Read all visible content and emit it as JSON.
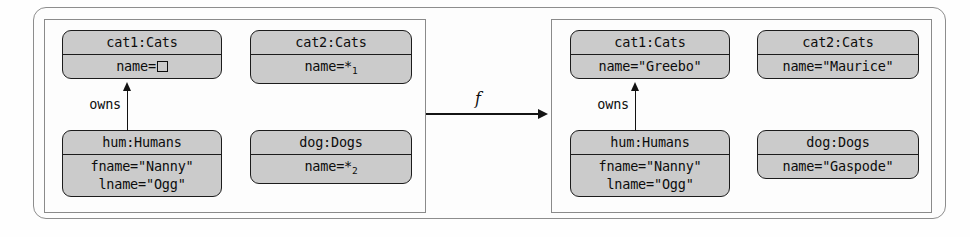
{
  "figure": {
    "background_color": "#fefefe",
    "box_fill_color": "#cbcbcb",
    "box_border_color": "#1c1c1c",
    "line_color": "#121212"
  },
  "transform_arrow": {
    "label": "f",
    "direction": "left-to-right"
  },
  "source_model": {
    "panel_name": "source-model-panel",
    "objects": [
      {
        "id": "cat1",
        "header": "cat1:Cats",
        "slots": [
          "name="
        ],
        "slot_glyph": "empty-square",
        "has_empty_square": true
      },
      {
        "id": "cat2",
        "header": "cat2:Cats",
        "slots": [
          "name=*"
        ],
        "subscript": "1",
        "has_empty_square": false
      },
      {
        "id": "hum",
        "header": "hum:Humans",
        "slots": [
          "fname=\"Nanny\"",
          "lname=\"Ogg\""
        ],
        "has_empty_square": false
      },
      {
        "id": "dog",
        "header": "dog:Dogs",
        "slots": [
          "name=*"
        ],
        "subscript": "2",
        "has_empty_square": false
      }
    ],
    "links": [
      {
        "label": "owns",
        "from": "hum",
        "to": "cat1"
      }
    ]
  },
  "target_model": {
    "panel_name": "target-model-panel",
    "objects": [
      {
        "id": "cat1",
        "header": "cat1:Cats",
        "slots": [
          "name=\"Greebo\""
        ],
        "has_empty_square": false
      },
      {
        "id": "cat2",
        "header": "cat2:Cats",
        "slots": [
          "name=\"Maurice\""
        ],
        "has_empty_square": false
      },
      {
        "id": "hum",
        "header": "hum:Humans",
        "slots": [
          "fname=\"Nanny\"",
          "lname=\"Ogg\""
        ],
        "has_empty_square": false
      },
      {
        "id": "dog",
        "header": "dog:Dogs",
        "slots": [
          "name=\"Gaspode\""
        ],
        "has_empty_square": false
      }
    ],
    "links": [
      {
        "label": "owns",
        "from": "hum",
        "to": "cat1"
      }
    ]
  }
}
